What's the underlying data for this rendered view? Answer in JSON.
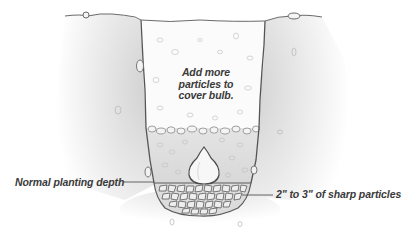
{
  "diagram": {
    "type": "cross-section illustration",
    "annotations": {
      "fill_note": "Add more particles to cover bulb.",
      "fill_note_lines": [
        "Add more",
        "particles to",
        "cover bulb."
      ],
      "planting_depth": "Normal planting depth",
      "drainage_layer": "2\" to 3\" of sharp particles"
    },
    "elements": [
      "ground-surface",
      "soil-left",
      "soil-right",
      "upper-fill-particles",
      "lower-fill-particles",
      "bulb",
      "sharp-particle-layer"
    ],
    "colors": {
      "text": "#3a3a3a",
      "outline": "#555555",
      "soil_shade": "#d9d9d9",
      "background": "#ffffff"
    }
  }
}
